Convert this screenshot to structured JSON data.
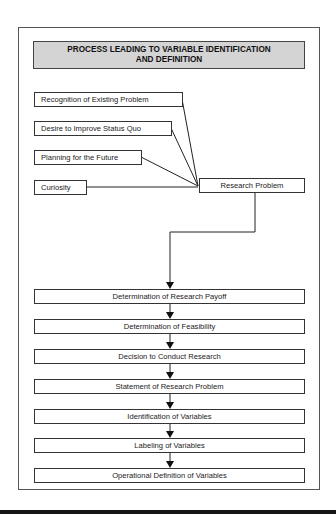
{
  "diagram": {
    "title_line1": "PROCESS LEADING TO VARIABLE IDENTIFICATION",
    "title_line2": "AND DEFINITION",
    "inputs": [
      {
        "label": "Recognition of Existing Problem"
      },
      {
        "label": "Desire to Improve Status Quo"
      },
      {
        "label": "Planning for the Future"
      },
      {
        "label": "Curiosity"
      }
    ],
    "hub": {
      "label": "Research Problem"
    },
    "steps": [
      {
        "label": "Determination of Research Payoff"
      },
      {
        "label": "Determination of Feasibility"
      },
      {
        "label": "Decision to Conduct Research"
      },
      {
        "label": "Statement of Research Problem"
      },
      {
        "label": "Identification of Variables"
      },
      {
        "label": "Labeling of Variables"
      },
      {
        "label": "Operational Definition of Variables"
      }
    ],
    "colors": {
      "title_fill": "#d4d4d4",
      "line": "#222222",
      "border": "#555555"
    }
  }
}
